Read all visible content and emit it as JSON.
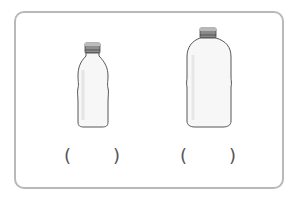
{
  "figure": {
    "items": [
      {
        "name": "small bottle",
        "answer_blank": {
          "open": "(",
          "close": ")"
        }
      },
      {
        "name": "large bottle",
        "answer_blank": {
          "open": "(",
          "close": ")"
        }
      }
    ],
    "colors": {
      "frame_border": "#b9b9b9",
      "bottle_outline": "#444444",
      "cap_fill": "#8a8a8a",
      "cap_dark": "#555555",
      "paren": "#555555"
    }
  }
}
